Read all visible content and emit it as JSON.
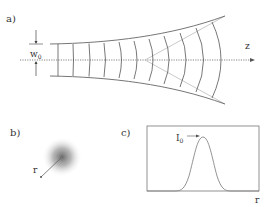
{
  "panel_a": {
    "label": "a)",
    "waist_label": "w",
    "waist_subscript": "0",
    "axis_label": "z"
  },
  "panel_b": {
    "label": "b)",
    "radius_label": "r"
  },
  "panel_c": {
    "label": "c)",
    "peak_label": "I",
    "peak_subscript": "0",
    "axis_label": "r"
  },
  "colors": {
    "line": "#555555",
    "envelope": "#666666",
    "asymptote": "#bbbbbb",
    "gaussian": "#888888",
    "spot": "#777777"
  }
}
